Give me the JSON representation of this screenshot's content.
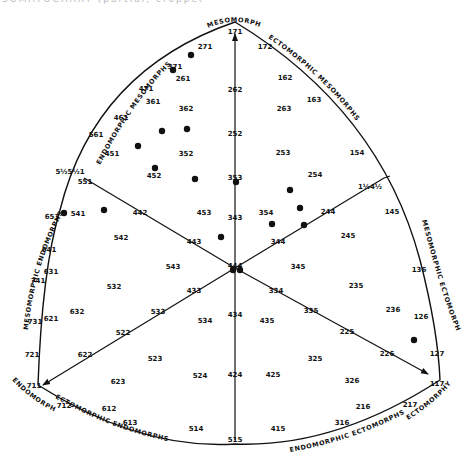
{
  "caption_fragment": "SOMATOCHART (partial, cropped)",
  "poles": {
    "mesomorphy": "MESOMORPHY",
    "endomorphy": "ENDOMORPHY",
    "ectomorphy": "ECTOMORPHY"
  },
  "regions": {
    "endomorphic_mesomorphs": [
      "ENDOMORPHIC",
      "MESOMORPHS"
    ],
    "ectomorphic_mesomorphs": [
      "ECTOMORPHIC",
      "MESOMORPHS"
    ],
    "mesomorphic_endomorphs": [
      "MESOMORPHIC",
      "ENDOMORPHS"
    ],
    "mesomorphic_ectomorphs": [
      "MESOMORPHIC",
      "ECTOMORPHS"
    ],
    "ectomorphic_endomorphs": [
      "ECTOMORPHIC",
      "ENDOMORPHS"
    ],
    "endomorphic_ectomorphs": [
      "ENDOMORPHIC",
      "ECTOMORPHS"
    ]
  },
  "colors": {
    "ink": "#111111",
    "background": "#ffffff"
  },
  "chart_data": {
    "type": "scatter",
    "axes": [
      "Endomorphy",
      "Mesomorphy",
      "Ectomorphy"
    ],
    "center": "444",
    "somatotype_labels": [
      {
        "t": "171",
        "x": 235,
        "y": 31
      },
      {
        "t": "271",
        "x": 205,
        "y": 46
      },
      {
        "t": "172",
        "x": 265,
        "y": 46
      },
      {
        "t": "371",
        "x": 175,
        "y": 66
      },
      {
        "t": "261",
        "x": 183,
        "y": 78
      },
      {
        "t": "471",
        "x": 146,
        "y": 88
      },
      {
        "t": "361",
        "x": 153,
        "y": 101
      },
      {
        "t": "362",
        "x": 186,
        "y": 108
      },
      {
        "t": "262",
        "x": 235,
        "y": 89
      },
      {
        "t": "162",
        "x": 285,
        "y": 77
      },
      {
        "t": "163",
        "x": 314,
        "y": 99
      },
      {
        "t": "263",
        "x": 284,
        "y": 108
      },
      {
        "t": "461",
        "x": 121,
        "y": 117
      },
      {
        "t": "561",
        "x": 96,
        "y": 134
      },
      {
        "t": "451",
        "x": 112,
        "y": 153
      },
      {
        "t": "352",
        "x": 186,
        "y": 153
      },
      {
        "t": "252",
        "x": 235,
        "y": 133
      },
      {
        "t": "253",
        "x": 283,
        "y": 152
      },
      {
        "t": "154",
        "x": 357,
        "y": 152
      },
      {
        "t": "452",
        "x": 154,
        "y": 175
      },
      {
        "t": "353",
        "x": 235,
        "y": 177
      },
      {
        "t": "254",
        "x": 315,
        "y": 174
      },
      {
        "t": "5½5½1",
        "x": 70,
        "y": 171
      },
      {
        "t": "551",
        "x": 85,
        "y": 181
      },
      {
        "t": "1½4½",
        "x": 370,
        "y": 186
      },
      {
        "t": "651",
        "x": 52,
        "y": 216
      },
      {
        "t": "541",
        "x": 78,
        "y": 213
      },
      {
        "t": "442",
        "x": 140,
        "y": 212
      },
      {
        "t": "453",
        "x": 204,
        "y": 212
      },
      {
        "t": "343",
        "x": 235,
        "y": 217
      },
      {
        "t": "354",
        "x": 266,
        "y": 212
      },
      {
        "t": "244",
        "x": 328,
        "y": 211
      },
      {
        "t": "145",
        "x": 392,
        "y": 211
      },
      {
        "t": "542",
        "x": 121,
        "y": 237
      },
      {
        "t": "443",
        "x": 194,
        "y": 241
      },
      {
        "t": "344",
        "x": 278,
        "y": 241
      },
      {
        "t": "245",
        "x": 348,
        "y": 235
      },
      {
        "t": "641",
        "x": 49,
        "y": 249
      },
      {
        "t": "631",
        "x": 51,
        "y": 271
      },
      {
        "t": "741",
        "x": 38,
        "y": 280
      },
      {
        "t": "543",
        "x": 173,
        "y": 266
      },
      {
        "t": "444",
        "x": 235,
        "y": 265
      },
      {
        "t": "345",
        "x": 298,
        "y": 266
      },
      {
        "t": "136",
        "x": 419,
        "y": 269
      },
      {
        "t": "532",
        "x": 114,
        "y": 286
      },
      {
        "t": "433",
        "x": 194,
        "y": 290
      },
      {
        "t": "334",
        "x": 276,
        "y": 290
      },
      {
        "t": "235",
        "x": 356,
        "y": 285
      },
      {
        "t": "621",
        "x": 51,
        "y": 318
      },
      {
        "t": "632",
        "x": 77,
        "y": 311
      },
      {
        "t": "533",
        "x": 158,
        "y": 311
      },
      {
        "t": "534",
        "x": 205,
        "y": 320
      },
      {
        "t": "434",
        "x": 235,
        "y": 314
      },
      {
        "t": "435",
        "x": 267,
        "y": 320
      },
      {
        "t": "335",
        "x": 311,
        "y": 310
      },
      {
        "t": "236",
        "x": 393,
        "y": 309
      },
      {
        "t": "126",
        "x": 421,
        "y": 316
      },
      {
        "t": "731",
        "x": 35,
        "y": 321
      },
      {
        "t": "522",
        "x": 123,
        "y": 332
      },
      {
        "t": "225",
        "x": 347,
        "y": 331
      },
      {
        "t": "721",
        "x": 32,
        "y": 354
      },
      {
        "t": "622",
        "x": 85,
        "y": 354
      },
      {
        "t": "523",
        "x": 155,
        "y": 358
      },
      {
        "t": "325",
        "x": 315,
        "y": 358
      },
      {
        "t": "226",
        "x": 387,
        "y": 353
      },
      {
        "t": "127",
        "x": 437,
        "y": 353
      },
      {
        "t": "524",
        "x": 200,
        "y": 375
      },
      {
        "t": "424",
        "x": 235,
        "y": 374
      },
      {
        "t": "425",
        "x": 273,
        "y": 374
      },
      {
        "t": "623",
        "x": 118,
        "y": 381
      },
      {
        "t": "326",
        "x": 352,
        "y": 380
      },
      {
        "t": "711",
        "x": 34,
        "y": 385
      },
      {
        "t": "117",
        "x": 437,
        "y": 383
      },
      {
        "t": "712",
        "x": 64,
        "y": 405
      },
      {
        "t": "612",
        "x": 109,
        "y": 408
      },
      {
        "t": "216",
        "x": 363,
        "y": 406
      },
      {
        "t": "217",
        "x": 410,
        "y": 404
      },
      {
        "t": "613",
        "x": 130,
        "y": 422
      },
      {
        "t": "514",
        "x": 196,
        "y": 428
      },
      {
        "t": "316",
        "x": 342,
        "y": 422
      },
      {
        "t": "415",
        "x": 278,
        "y": 428
      },
      {
        "t": "515",
        "x": 235,
        "y": 439
      }
    ],
    "points": [
      {
        "x": 191,
        "y": 55
      },
      {
        "x": 173,
        "y": 70
      },
      {
        "x": 162,
        "y": 131
      },
      {
        "x": 187,
        "y": 129
      },
      {
        "x": 138,
        "y": 146
      },
      {
        "x": 155,
        "y": 168
      },
      {
        "x": 195,
        "y": 179
      },
      {
        "x": 236,
        "y": 182
      },
      {
        "x": 104,
        "y": 210
      },
      {
        "x": 64,
        "y": 213
      },
      {
        "x": 290,
        "y": 190
      },
      {
        "x": 300,
        "y": 208
      },
      {
        "x": 272,
        "y": 224
      },
      {
        "x": 304,
        "y": 225
      },
      {
        "x": 221,
        "y": 237
      },
      {
        "x": 233,
        "y": 270
      },
      {
        "x": 240,
        "y": 270
      },
      {
        "x": 414,
        "y": 340
      }
    ]
  }
}
